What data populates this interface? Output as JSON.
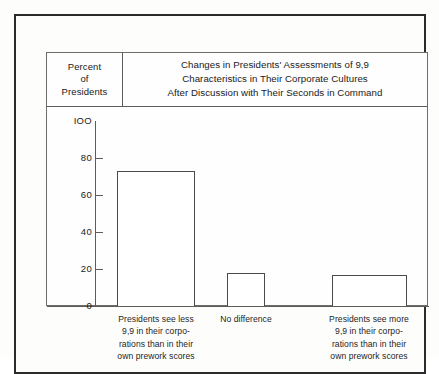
{
  "chart_data": {
    "type": "bar",
    "title": "Changes in Presidents' Assessments of 9,9 Characteristics in Their Corporate Cultures After Discussion with Their Seconds in Command",
    "title_lines": [
      "Changes in Presidents' Assessments of 9,9",
      "Characteristics in Their Corporate Cultures",
      "After Discussion with Their Seconds in Command"
    ],
    "ylabel": "Percent of Presidents",
    "ylabel_lines": [
      "Percent",
      "of",
      "Presidents"
    ],
    "xlabel": "",
    "ylim": [
      0,
      100
    ],
    "yticks": [
      0,
      20,
      40,
      60,
      80,
      100
    ],
    "ytick_labels": [
      "0",
      "20",
      "40",
      "60",
      "80",
      "IOO"
    ],
    "grid": false,
    "legend": false,
    "categories": [
      "Presidents see less 9,9 in their corporations than in their own prework scores",
      "No difference",
      "Presidents see more 9,9 in their corporations than in their own prework scores"
    ],
    "category_lines": [
      [
        "Presidents see less",
        "9,9 in their corpo-",
        "rations than in their",
        "own prework scores"
      ],
      [
        "No difference"
      ],
      [
        "Presidents see more",
        "9,9 in their corpo-",
        "rations than in their",
        "own prework scores"
      ]
    ],
    "values": [
      73,
      18,
      17
    ],
    "bar_color": "#ffffff",
    "bar_edge_color": "#4a4a4a",
    "axis_color": "#5c5c5c",
    "text_color": "#1a1a1a",
    "background_color": "#fdfdfc"
  }
}
